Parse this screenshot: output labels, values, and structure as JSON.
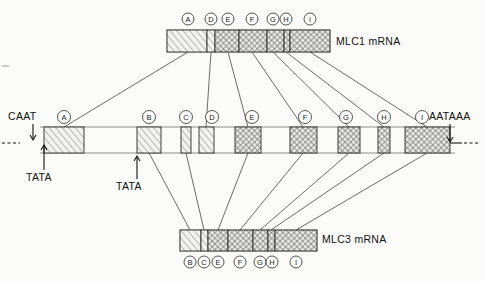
{
  "figure": {
    "background": "#fbfbf9"
  },
  "labels": {
    "mlc1": "MLC1 mRNA",
    "mlc3": "MLC3 mRNA",
    "caat": "CAAT",
    "tata1": "TATA",
    "tata2": "TATA",
    "aataaa": "AATAAA"
  },
  "mlc1_mrna": {
    "label": "MLC1 mRNA",
    "x": 167,
    "y": 30,
    "width": 163,
    "height": 22,
    "exons": [
      {
        "id": "A",
        "label": "A",
        "x": 167,
        "width": 40,
        "fill": "hatch-a",
        "tick_x": 188
      },
      {
        "id": "D",
        "label": "D",
        "x": 207,
        "width": 8,
        "fill": "hatch-a",
        "tick_x": 211
      },
      {
        "id": "E",
        "label": "E",
        "x": 215,
        "width": 24,
        "fill": "cross-b",
        "tick_x": 228
      },
      {
        "id": "F",
        "label": "F",
        "x": 239,
        "width": 28,
        "fill": "cross-b",
        "tick_x": 252
      },
      {
        "id": "G",
        "label": "G",
        "x": 267,
        "width": 17,
        "fill": "cross-b",
        "tick_x": 273
      },
      {
        "id": "H",
        "label": "H",
        "x": 284,
        "width": 6,
        "fill": "cross-b",
        "tick_x": 286
      },
      {
        "id": "I",
        "label": "I",
        "x": 290,
        "width": 40,
        "fill": "cross-b",
        "tick_x": 310
      }
    ]
  },
  "mlc3_mrna": {
    "label": "MLC3 mRNA",
    "x": 180,
    "y": 230,
    "width": 137,
    "height": 21,
    "exons": [
      {
        "id": "B",
        "label": "B",
        "x": 180,
        "width": 21,
        "fill": "hatch-a",
        "tick_x": 190
      },
      {
        "id": "C",
        "label": "C",
        "x": 201,
        "width": 7,
        "fill": "hatch-a",
        "tick_x": 204
      },
      {
        "id": "E",
        "label": "E",
        "x": 208,
        "width": 20,
        "fill": "cross-b",
        "tick_x": 218
      },
      {
        "id": "F",
        "label": "F",
        "x": 228,
        "width": 25,
        "fill": "cross-b",
        "tick_x": 240
      },
      {
        "id": "G",
        "label": "G",
        "x": 253,
        "width": 15,
        "fill": "cross-b",
        "tick_x": 260
      },
      {
        "id": "H",
        "label": "H",
        "x": 268,
        "width": 7,
        "fill": "cross-b",
        "tick_x": 271
      },
      {
        "id": "I",
        "label": "I",
        "x": 275,
        "width": 42,
        "fill": "cross-b",
        "tick_x": 296
      }
    ]
  },
  "gene": {
    "y": 127,
    "height": 26,
    "line_left": 40,
    "line_right": 455,
    "exons": [
      {
        "id": "A",
        "label": "A",
        "x": 44,
        "width": 40,
        "fill": "hatch-a",
        "center": 64
      },
      {
        "id": "B",
        "label": "B",
        "x": 137,
        "width": 24,
        "fill": "hatch-a",
        "center": 149
      },
      {
        "id": "C",
        "label": "C",
        "x": 181,
        "width": 10,
        "fill": "hatch-a",
        "center": 186
      },
      {
        "id": "D",
        "label": "D",
        "x": 199,
        "width": 15,
        "fill": "hatch-a",
        "center": 206
      },
      {
        "id": "E",
        "label": "E",
        "x": 235,
        "width": 26,
        "fill": "cross-b",
        "center": 248
      },
      {
        "id": "F",
        "label": "F",
        "x": 290,
        "width": 27,
        "fill": "cross-b",
        "center": 303
      },
      {
        "id": "G",
        "label": "G",
        "x": 338,
        "width": 22,
        "fill": "cross-b",
        "center": 349
      },
      {
        "id": "H",
        "label": "H",
        "x": 378,
        "width": 12,
        "fill": "cross-b",
        "center": 384
      },
      {
        "id": "I",
        "label": "I",
        "x": 405,
        "width": 45,
        "fill": "cross-b",
        "center": 427
      }
    ]
  },
  "annotations": {
    "caat": {
      "text": "CAAT",
      "x": 8,
      "y": 119,
      "arrow_x": 33,
      "arrow_top": 122,
      "arrow_bottom": 138
    },
    "tata1": {
      "text": "TATA",
      "x": 27,
      "y": 178,
      "arrow_x": 44,
      "arrow_top": 155,
      "arrow_bottom": 142
    },
    "tata2": {
      "text": "TATA",
      "x": 117,
      "y": 188,
      "arrow_x": 137,
      "arrow_top": 165,
      "arrow_bottom": 152
    },
    "aataaa": {
      "text": "AATAAA",
      "x": 432,
      "y": 119,
      "arrow_x": 450,
      "arrow_top": 122,
      "arrow_bottom": 140
    }
  },
  "connectors_top": [
    {
      "from_x": 64,
      "from_y": 127,
      "to_x": 188,
      "to_y": 52
    },
    {
      "from_x": 206,
      "from_y": 127,
      "to_x": 211,
      "to_y": 52
    },
    {
      "from_x": 248,
      "from_y": 127,
      "to_x": 228,
      "to_y": 52
    },
    {
      "from_x": 303,
      "from_y": 127,
      "to_x": 252,
      "to_y": 52
    },
    {
      "from_x": 349,
      "from_y": 127,
      "to_x": 273,
      "to_y": 52
    },
    {
      "from_x": 384,
      "from_y": 127,
      "to_x": 286,
      "to_y": 52
    },
    {
      "from_x": 427,
      "from_y": 127,
      "to_x": 310,
      "to_y": 52
    }
  ],
  "connectors_bottom": [
    {
      "from_x": 149,
      "from_y": 153,
      "to_x": 190,
      "to_y": 230
    },
    {
      "from_x": 186,
      "from_y": 153,
      "to_x": 204,
      "to_y": 230
    },
    {
      "from_x": 248,
      "from_y": 153,
      "to_x": 218,
      "to_y": 230
    },
    {
      "from_x": 303,
      "from_y": 153,
      "to_x": 240,
      "to_y": 230
    },
    {
      "from_x": 349,
      "from_y": 153,
      "to_x": 260,
      "to_y": 230
    },
    {
      "from_x": 384,
      "from_y": 153,
      "to_x": 271,
      "to_y": 230
    },
    {
      "from_x": 427,
      "from_y": 153,
      "to_x": 296,
      "to_y": 230
    }
  ],
  "edge_marks": {
    "left_dash": {
      "x1": 2,
      "x2": 18,
      "y": 143
    },
    "left_tick": {
      "x": 2,
      "y1": 66,
      "y2": 70
    },
    "right_dash": {
      "x1": 462,
      "x2": 478,
      "y": 143
    }
  }
}
